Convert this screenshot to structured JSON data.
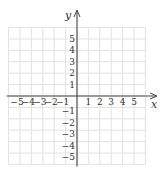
{
  "chart_data": {
    "type": "scatter",
    "title": "",
    "xlabel": "x",
    "ylabel": "y",
    "xlim": [
      -6,
      6
    ],
    "ylim": [
      -6,
      6
    ],
    "grid": true,
    "x_tick_labels": [
      "-5",
      "-4",
      "-3",
      "-2",
      "-1",
      "1",
      "2",
      "3",
      "4",
      "5"
    ],
    "y_tick_labels": [
      "5",
      "4",
      "3",
      "2",
      "1",
      "-1",
      "-2",
      "-3",
      "-4",
      "-5"
    ],
    "series": [],
    "legend": null
  },
  "colors": {
    "grid": "#e2e2e2",
    "axis": "#444444",
    "text": "#333333",
    "background": "#ffffff"
  }
}
